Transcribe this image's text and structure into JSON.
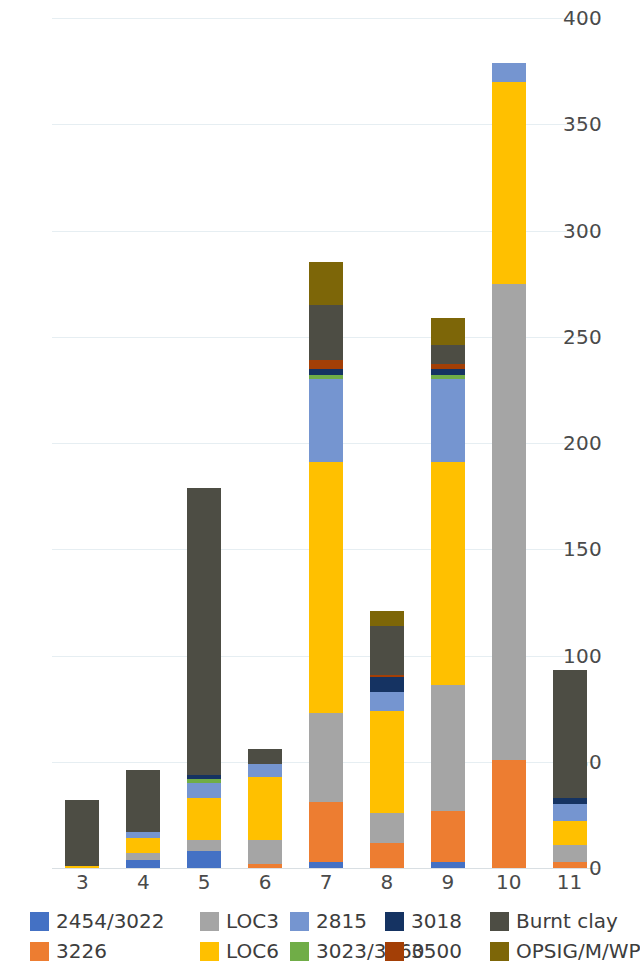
{
  "chart_data": {
    "type": "bar",
    "subtype": "stacked-bar",
    "title": "",
    "xlabel": "",
    "ylabel": "",
    "ylim": [
      0,
      400
    ],
    "yticks": [
      0,
      50,
      100,
      150,
      200,
      250,
      300,
      350,
      400
    ],
    "ytick_labels": [
      "0",
      "50",
      "100",
      "150",
      "200",
      "250",
      "300",
      "350",
      "400"
    ],
    "grid": true,
    "legend_position": "bottom",
    "categories": [
      "3",
      "4",
      "5",
      "6",
      "7",
      "8",
      "9",
      "10",
      "11"
    ],
    "series": [
      {
        "name": "2454/3022",
        "color": "#4471c4",
        "values": [
          0,
          4,
          8,
          0,
          3,
          0,
          3,
          0,
          0
        ]
      },
      {
        "name": "3226",
        "color": "#ed7d31",
        "values": [
          0,
          0,
          0,
          2,
          28,
          12,
          24,
          51,
          3
        ]
      },
      {
        "name": "LOC3",
        "color": "#a5a5a5",
        "values": [
          0,
          3,
          5,
          11,
          42,
          14,
          59,
          224,
          8
        ]
      },
      {
        "name": "LOC6",
        "color": "#ffc000",
        "values": [
          1,
          7,
          20,
          30,
          118,
          48,
          105,
          95,
          11
        ]
      },
      {
        "name": "2815",
        "color": "#7595d0",
        "values": [
          0,
          3,
          7,
          6,
          39,
          9,
          39,
          9,
          8
        ]
      },
      {
        "name": "3023/3060",
        "color": "#70ad47",
        "values": [
          0,
          0,
          2,
          0,
          2,
          0,
          2,
          0,
          0
        ]
      },
      {
        "name": "3018",
        "color": "#153362",
        "values": [
          0,
          0,
          2,
          0,
          3,
          7,
          3,
          0,
          3
        ]
      },
      {
        "name": "3500",
        "color": "#a33f06",
        "values": [
          0,
          0,
          0,
          0,
          4,
          1,
          2,
          0,
          0
        ]
      },
      {
        "name": "Burnt clay",
        "color": "#4d4d44",
        "values": [
          31,
          29,
          135,
          7,
          26,
          23,
          9,
          0,
          60
        ]
      },
      {
        "name": "OPSIG/M/WP",
        "color": "#7d6608",
        "values": [
          0,
          0,
          0,
          0,
          20,
          7,
          13,
          0,
          0
        ]
      }
    ],
    "totals": [
      32,
      46,
      179,
      56,
      285,
      121,
      259,
      379,
      93
    ]
  },
  "legend": {
    "items": [
      {
        "label": "2454/3022",
        "color": "#4471c4"
      },
      {
        "label": "3226",
        "color": "#ed7d31"
      },
      {
        "label": "LOC3",
        "color": "#a5a5a5"
      },
      {
        "label": "LOC6",
        "color": "#ffc000"
      },
      {
        "label": "2815",
        "color": "#7595d0"
      },
      {
        "label": "3023/3060",
        "color": "#70ad47"
      },
      {
        "label": "3018",
        "color": "#153362"
      },
      {
        "label": "3500",
        "color": "#a33f06"
      },
      {
        "label": "Burnt clay",
        "color": "#4d4d44"
      },
      {
        "label": "OPSIG/M/WP",
        "color": "#7d6608"
      }
    ]
  },
  "colors": {
    "background": "#ffffff",
    "gridline": "#e6eef2",
    "axis_text": "#4a4a4a"
  }
}
